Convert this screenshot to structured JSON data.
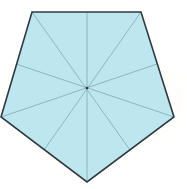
{
  "diagram": {
    "title": "",
    "shape": "regular pentagon",
    "colors": {
      "fill": "#bde6ef",
      "outline": "#2f3a3f",
      "symmetry_lines": "#7ea9b6",
      "background_glow": "#fdf0cf"
    },
    "vertices": [
      [
        32,
        12
      ],
      [
        141,
        12
      ],
      [
        174,
        117
      ],
      [
        87,
        182
      ],
      [
        1,
        117
      ]
    ],
    "center": [
      87,
      88
    ],
    "symmetry_line_count": 5
  }
}
